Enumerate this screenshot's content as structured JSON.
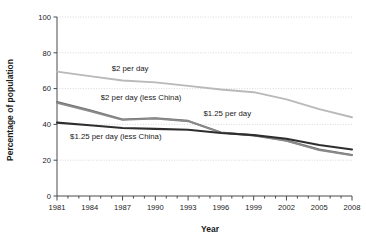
{
  "chart_data": {
    "type": "line",
    "title": "",
    "xlabel": "Year",
    "ylabel": "Percentage of population",
    "xlim": [
      1981,
      2008
    ],
    "ylim": [
      0,
      100
    ],
    "yticks": [
      0,
      20,
      40,
      60,
      80,
      100
    ],
    "xticks": [
      1981,
      1984,
      1987,
      1990,
      1993,
      1996,
      1999,
      2002,
      2005,
      2008
    ],
    "xtick_labels": [
      "1981",
      "1984",
      "1987",
      "1990",
      "1993",
      "1996",
      "1999",
      "2002",
      "2005",
      "2008"
    ],
    "ytick_labels": [
      "0",
      "20",
      "40",
      "60",
      "80",
      "100"
    ],
    "grid": true,
    "grid_axis": "y",
    "grid_style": "dotted",
    "legend_position": "inline-annotations",
    "x": [
      1981,
      1984,
      1987,
      1990,
      1993,
      1996,
      1999,
      2002,
      2005,
      2008
    ],
    "series": [
      {
        "name": "$2 per day",
        "color": "#b9b9b9",
        "values": [
          69.5,
          67.0,
          64.5,
          63.5,
          61.5,
          59.5,
          58.0,
          54.0,
          48.5,
          44.0
        ],
        "label": "$2 per day",
        "label_x": 1986.0,
        "label_y": 70.0
      },
      {
        "name": "$2 per day (less China)",
        "color": "#6f6f6f",
        "values": [
          52.5,
          48.0,
          42.8,
          43.5,
          42.0,
          35.5,
          34.0,
          31.0,
          26.0,
          23.0
        ],
        "label": "$2 per day (less China)",
        "label_x": 1985.0,
        "label_y": 53.5
      },
      {
        "name": "$1.25 per day",
        "color": "#8a8a8a",
        "values": [
          52.0,
          47.5,
          42.5,
          43.2,
          41.8,
          35.4,
          33.8,
          30.8,
          25.6,
          22.8
        ],
        "label": "$1.25 per day",
        "label_x": 1994.4,
        "label_y": 44.5
      },
      {
        "name": "$1.25 per day (less China)",
        "color": "#2e2e2e",
        "values": [
          41.0,
          39.5,
          38.0,
          37.5,
          37.0,
          35.2,
          34.0,
          32.0,
          28.5,
          26.0
        ],
        "label": "$1.25 per day (less China)",
        "label_x": 1982.2,
        "label_y": 32.0
      }
    ]
  }
}
